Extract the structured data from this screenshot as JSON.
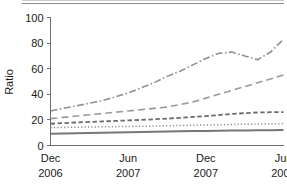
{
  "figure": {
    "background_color": "#ffffff",
    "top_rule_color": "#8d8d8d"
  },
  "chart_data": {
    "type": "line",
    "title": "",
    "subtitle": "",
    "xlabel": "",
    "ylabel": "Ratio",
    "ylim": [
      0,
      100
    ],
    "yticks": [
      0,
      20,
      40,
      60,
      80,
      100
    ],
    "ytick_labels": [
      "0",
      "20",
      "40",
      "60",
      "80",
      "100"
    ],
    "xtick_labels": [
      {
        "month": "Dec",
        "year": "2006"
      },
      {
        "month": "Jun",
        "year": "2007"
      },
      {
        "month": "Dec",
        "year": "2007"
      },
      {
        "month": "Jun",
        "year": "2008"
      }
    ],
    "xtick_positions": [
      0,
      6,
      12,
      18
    ],
    "xlim": [
      0,
      18
    ],
    "grid": false,
    "legend": "none",
    "x": [
      0,
      1,
      2,
      3,
      4,
      5,
      6,
      7,
      8,
      9,
      10,
      11,
      12,
      13,
      14,
      15,
      16,
      17,
      18
    ],
    "series": [
      {
        "name": "series-1",
        "line_style": "dash-dot",
        "color": "#8f8f8f",
        "stroke_width": 1.6,
        "dasharray": "7,2.5,1.5,2.5",
        "values": [
          27,
          29,
          31,
          33,
          35,
          38,
          41,
          45,
          49,
          54,
          58,
          63,
          68,
          72,
          73,
          70,
          67,
          73,
          83
        ]
      },
      {
        "name": "series-2",
        "line_style": "long-dash",
        "color": "#9a9a9a",
        "stroke_width": 1.6,
        "dasharray": "7,4",
        "values": [
          21,
          22,
          23,
          24,
          25,
          26,
          27,
          28,
          29,
          30,
          32,
          34,
          37,
          40,
          43,
          46,
          49,
          52,
          55
        ]
      },
      {
        "name": "series-3",
        "line_style": "medium-dash",
        "color": "#6b6b6b",
        "stroke_width": 1.8,
        "dasharray": "4.5,2.5",
        "values": [
          17,
          17.5,
          18,
          18.4,
          18.8,
          19.2,
          19.6,
          20,
          20.5,
          21,
          21.6,
          22.3,
          23,
          23.8,
          24.6,
          25.3,
          25.8,
          26,
          26
        ]
      },
      {
        "name": "series-4",
        "line_style": "dotted",
        "color": "#8a8a8a",
        "stroke_width": 1.5,
        "dasharray": "1.2,2.2",
        "values": [
          14,
          14.1,
          14.3,
          14.4,
          14.6,
          14.7,
          14.9,
          15,
          15.2,
          15.4,
          15.6,
          15.8,
          16,
          16.2,
          16.4,
          16.6,
          16.8,
          17,
          17.1
        ]
      },
      {
        "name": "series-5",
        "line_style": "solid",
        "color": "#777777",
        "stroke_width": 2.0,
        "dasharray": "none",
        "values": [
          9.2,
          9.4,
          9.6,
          9.8,
          10,
          10.2,
          10.4,
          10.6,
          10.8,
          11,
          11.1,
          11.3,
          11.4,
          11.6,
          11.7,
          11.8,
          11.9,
          12,
          12.1
        ]
      }
    ]
  }
}
